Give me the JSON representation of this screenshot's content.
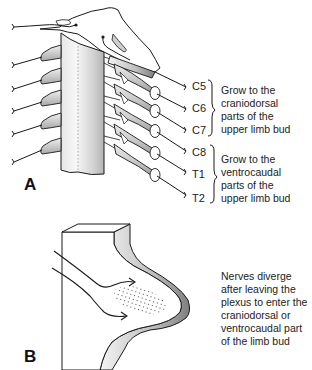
{
  "figure": {
    "panel_a": {
      "letter": "A",
      "nerve_labels": [
        "C5",
        "C6",
        "C7",
        "C8",
        "T1",
        "T2"
      ],
      "group_1": {
        "members": [
          "C5",
          "C6",
          "C7"
        ],
        "caption_lines": [
          "Grow to the",
          "craniodorsal",
          "parts of the",
          "upper limb bud"
        ]
      },
      "group_2": {
        "members": [
          "C8",
          "T1",
          "T2"
        ],
        "caption_lines": [
          "Grow to the",
          "ventrocaudal",
          "parts of the",
          "upper limb bud"
        ]
      }
    },
    "panel_b": {
      "letter": "B",
      "caption_lines": [
        "Nerves diverge",
        "after leaving the",
        "plexus to enter the",
        "craniodorsal or",
        "ventrocaudal part",
        "of the limb bud"
      ]
    }
  },
  "colors": {
    "line": "#1a1a1a",
    "shade_light": "#f2f2f2",
    "shade_mid": "#cfcfcf",
    "shade_dark": "#9a9a9a",
    "background": "#ffffff"
  }
}
